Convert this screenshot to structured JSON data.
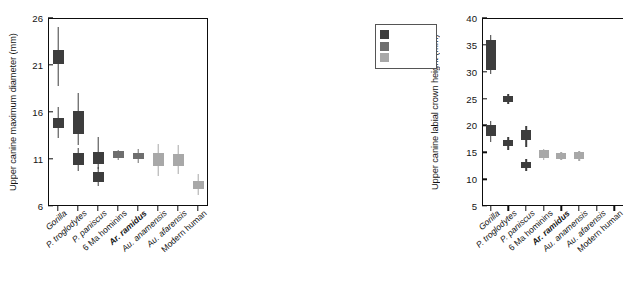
{
  "figure": {
    "name": "upper-canine-boxplots",
    "categories": [
      "Gorilla",
      "P. troglodytes",
      "P. paniscus",
      "6 Ma hominins",
      "Ar. ramidus",
      "Au. anamensis",
      "Au. afarensis",
      "Modern human"
    ],
    "category_styles": [
      "italic",
      "italic",
      "italic",
      "upright",
      "bolditalic",
      "italic",
      "italic",
      "upright"
    ],
    "colors": {
      "dark": "#3d3d3d",
      "medium": "#6e6e6e",
      "light": "#a8a8a8",
      "axis": "#0d0d0d"
    },
    "legend": {
      "title": "",
      "items": [
        {
          "label": "",
          "color_key": "dark"
        },
        {
          "label": "",
          "color_key": "medium"
        },
        {
          "label": "",
          "color_key": "light"
        }
      ]
    }
  },
  "chart_data": [
    {
      "id": "left",
      "type": "box",
      "title": "",
      "ylabel": "Upper canine maximum diameter (mm)",
      "xlabel": "",
      "ylim": [
        6,
        26
      ],
      "yticks": [
        6,
        11,
        16,
        21,
        26
      ],
      "grid": false,
      "categories": [
        "Gorilla",
        "P. troglodytes",
        "P. paniscus",
        "6 Ma hominins",
        "Ar. ramidus",
        "Au. anamensis",
        "Au. afarensis",
        "Modern human"
      ],
      "boxes": [
        {
          "category": "Gorilla",
          "whisker_low": 18.8,
          "q1": 21.1,
          "q3": 22.6,
          "whisker_high": 25.0,
          "color_key": "dark"
        },
        {
          "category": "Gorilla",
          "whisker_low": 13.2,
          "q1": 14.3,
          "q3": 15.4,
          "whisker_high": 16.5,
          "color_key": "dark",
          "note": "female cluster"
        },
        {
          "category": "P. troglodytes",
          "whisker_low": 9.7,
          "q1": 10.4,
          "q3": 11.6,
          "whisker_high": 12.2,
          "color_key": "dark"
        },
        {
          "category": "P. troglodytes",
          "whisker_low": 12.5,
          "q1": 13.7,
          "q3": 16.1,
          "whisker_high": 18.0,
          "color_key": "dark"
        },
        {
          "category": "P. paniscus",
          "whisker_low": 8.1,
          "q1": 8.6,
          "q3": 9.6,
          "whisker_high": 10.1,
          "color_key": "dark"
        },
        {
          "category": "P. paniscus",
          "whisker_low": 9.9,
          "q1": 10.5,
          "q3": 11.7,
          "whisker_high": 13.3,
          "color_key": "dark"
        },
        {
          "category": "6 Ma hominins",
          "whisker_low": 10.9,
          "q1": 11.1,
          "q3": 11.8,
          "whisker_high": 12.0,
          "color_key": "medium"
        },
        {
          "category": "Ar. ramidus",
          "whisker_low": 10.6,
          "q1": 11.0,
          "q3": 11.6,
          "whisker_high": 12.1,
          "color_key": "medium"
        },
        {
          "category": "Au. anamensis",
          "whisker_low": 9.2,
          "q1": 10.3,
          "q3": 11.6,
          "whisker_high": 12.6,
          "color_key": "light"
        },
        {
          "category": "Au. afarensis",
          "whisker_low": 9.4,
          "q1": 10.3,
          "q3": 11.5,
          "whisker_high": 12.5,
          "color_key": "light"
        },
        {
          "category": "Modern human",
          "whisker_low": 7.2,
          "q1": 7.8,
          "q3": 8.7,
          "whisker_high": 9.4,
          "color_key": "light"
        }
      ]
    },
    {
      "id": "right",
      "type": "box",
      "title": "",
      "ylabel": "Upper canine labial crown height (mm)",
      "xlabel": "",
      "ylim": [
        5,
        40
      ],
      "yticks": [
        5,
        10,
        15,
        20,
        25,
        30,
        35,
        40
      ],
      "grid": false,
      "categories": [
        "Gorilla",
        "P. troglodytes",
        "P. paniscus",
        "6 Ma hominins",
        "Ar. ramidus",
        "Au. anamensis",
        "Au. afarensis",
        "Modern human"
      ],
      "boxes": [
        {
          "category": "Gorilla",
          "whisker_low": 29.6,
          "q1": 30.3,
          "q3": 35.9,
          "whisker_high": 36.8,
          "color_key": "dark"
        },
        {
          "category": "Gorilla",
          "whisker_low": 17.0,
          "q1": 18.0,
          "q3": 20.0,
          "whisker_high": 20.9,
          "color_key": "dark"
        },
        {
          "category": "P. troglodytes",
          "whisker_low": 24.0,
          "q1": 24.4,
          "q3": 25.4,
          "whisker_high": 25.8,
          "color_key": "dark"
        },
        {
          "category": "P. troglodytes",
          "whisker_low": 15.4,
          "q1": 16.1,
          "q3": 17.3,
          "whisker_high": 17.9,
          "color_key": "dark"
        },
        {
          "category": "P. paniscus",
          "whisker_low": 11.6,
          "q1": 12.1,
          "q3": 13.2,
          "whisker_high": 13.8,
          "color_key": "dark"
        },
        {
          "category": "P. paniscus",
          "whisker_low": 16.0,
          "q1": 17.2,
          "q3": 19.2,
          "whisker_high": 19.9,
          "color_key": "dark"
        },
        {
          "category": "6 Ma hominins",
          "whisker_low": 13.6,
          "q1": 13.9,
          "q3": 15.4,
          "whisker_high": 15.7,
          "color_key": "light"
        },
        {
          "category": "Ar. ramidus",
          "whisker_low": 13.5,
          "q1": 13.8,
          "q3": 14.8,
          "whisker_high": 15.1,
          "color_key": "light"
        },
        {
          "category": "Au. anamensis",
          "whisker_low": 13.4,
          "q1": 13.7,
          "q3": 15.0,
          "whisker_high": 15.3,
          "color_key": "light"
        }
      ]
    }
  ]
}
